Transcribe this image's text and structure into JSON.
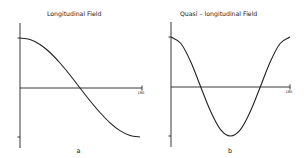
{
  "chart_data": [
    {
      "type": "line",
      "panel_label": "a",
      "title": "Longitudinal   Field",
      "xlabel": "",
      "ylabel": "",
      "x_end_tick_label": "180",
      "xlim": [
        0,
        180
      ],
      "ylim": [
        -1,
        1
      ],
      "grid": false,
      "series": [
        {
          "name": "cos(θ)",
          "x": [
            0,
            15,
            30,
            45,
            60,
            75,
            90,
            105,
            120,
            135,
            150,
            165,
            180
          ],
          "values": [
            1.0,
            0.97,
            0.87,
            0.71,
            0.5,
            0.26,
            0.0,
            -0.26,
            -0.5,
            -0.71,
            -0.87,
            -0.97,
            -1.0
          ]
        }
      ]
    },
    {
      "type": "line",
      "panel_label": "b",
      "title": "Quasi – longitudinal   Field",
      "xlabel": "",
      "ylabel": "",
      "x_end_tick_label": "180",
      "xlim": [
        0,
        180
      ],
      "ylim": [
        -1,
        1
      ],
      "grid": false,
      "series": [
        {
          "name": "cos(2θ)",
          "x": [
            0,
            15,
            30,
            45,
            60,
            75,
            90,
            105,
            120,
            135,
            150,
            165,
            180
          ],
          "values": [
            1.0,
            0.87,
            0.5,
            0.0,
            -0.5,
            -0.87,
            -1.0,
            -0.87,
            -0.5,
            0.0,
            0.5,
            0.87,
            1.0
          ]
        }
      ]
    }
  ]
}
